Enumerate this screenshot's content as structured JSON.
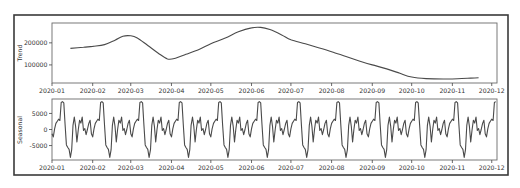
{
  "chart_data": [
    {
      "type": "line",
      "title": "",
      "xlabel": "",
      "ylabel": "Trend",
      "x_ticks": [
        "2020-01",
        "2020-02",
        "2020-03",
        "2020-04",
        "2020-05",
        "2020-06",
        "2020-07",
        "2020-08",
        "2020-09",
        "2020-10",
        "2020-11",
        "2020-12"
      ],
      "y_ticks": [
        100000,
        200000
      ],
      "y_tick_labels": [
        "100000",
        "200000"
      ],
      "ylim": [
        18000,
        290000
      ],
      "grid": false,
      "series": [
        {
          "name": "trend",
          "points": [
            [
              "2020-01-15",
              175000
            ],
            [
              "2020-01-25",
              180000
            ],
            [
              "2020-02-01",
              184000
            ],
            [
              "2020-02-10",
              192000
            ],
            [
              "2020-02-18",
              212000
            ],
            [
              "2020-02-24",
              230000
            ],
            [
              "2020-03-01",
              232000
            ],
            [
              "2020-03-06",
              222000
            ],
            [
              "2020-03-14",
              188000
            ],
            [
              "2020-03-22",
              153000
            ],
            [
              "2020-03-29",
              127000
            ],
            [
              "2020-04-04",
              130000
            ],
            [
              "2020-04-12",
              148000
            ],
            [
              "2020-04-22",
              170000
            ],
            [
              "2020-05-01",
              196000
            ],
            [
              "2020-05-12",
              222000
            ],
            [
              "2020-05-22",
              250000
            ],
            [
              "2020-06-01",
              268000
            ],
            [
              "2020-06-08",
              270000
            ],
            [
              "2020-06-15",
              260000
            ],
            [
              "2020-06-24",
              236000
            ],
            [
              "2020-07-01",
              214000
            ],
            [
              "2020-07-12",
              196000
            ],
            [
              "2020-07-22",
              178000
            ],
            [
              "2020-08-01",
              160000
            ],
            [
              "2020-08-12",
              138000
            ],
            [
              "2020-08-22",
              118000
            ],
            [
              "2020-09-01",
              100000
            ],
            [
              "2020-09-12",
              82000
            ],
            [
              "2020-09-22",
              62000
            ],
            [
              "2020-10-01",
              45000
            ],
            [
              "2020-10-12",
              38000
            ],
            [
              "2020-10-25",
              36000
            ],
            [
              "2020-11-05",
              37000
            ],
            [
              "2020-11-15",
              40000
            ],
            [
              "2020-11-21",
              42000
            ]
          ]
        }
      ]
    },
    {
      "type": "line",
      "title": "",
      "xlabel": "",
      "ylabel": "Seasonal",
      "x_ticks": [
        "2020-01",
        "2020-02",
        "2020-03",
        "2020-04",
        "2020-05",
        "2020-06",
        "2020-07",
        "2020-08",
        "2020-09",
        "2020-10",
        "2020-11",
        "2020-12"
      ],
      "y_ticks": [
        -5000,
        0,
        5000
      ],
      "y_tick_labels": [
        "-5000",
        "0",
        "5000"
      ],
      "ylim": [
        -9500,
        9500
      ],
      "grid": false,
      "period_days": 30,
      "x_start": "2020-01-01",
      "x_end": "2020-12-04",
      "series": [
        {
          "name": "seasonal",
          "one_period_values": [
            -1300,
            -2300,
            200,
            1900,
            2600,
            3200,
            2800,
            8400,
            8700,
            8300,
            1500,
            -4800,
            -5600,
            -6200,
            -8700,
            -6300,
            1300,
            3900,
            1000,
            -3900,
            0,
            2900,
            2000,
            3900,
            -300,
            300,
            -1600,
            0,
            1900,
            2900
          ]
        }
      ]
    }
  ],
  "axes": {
    "trend_label": "Trend",
    "seasonal_label": "Seasonal"
  }
}
